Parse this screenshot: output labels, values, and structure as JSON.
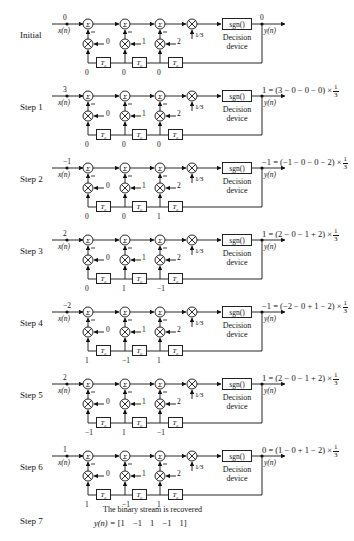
{
  "figure": {
    "decision_device": {
      "box_label": "sgn()",
      "caption_line1": "Decision",
      "caption_line2": "device"
    },
    "input_label": "x(n)",
    "output_label": "y(n)",
    "delay_label": "T",
    "delay_sub": "c",
    "gain_num": "1",
    "gain_den": "3",
    "frac_num": "1",
    "frac_den": "3",
    "coefficients": [
      "0",
      "1",
      "2"
    ],
    "stages": [
      {
        "label": "Initial",
        "input": "0",
        "taps": [
          "0",
          "0",
          "0"
        ],
        "output_value": "0",
        "equation": ""
      },
      {
        "label": "Step 1",
        "input": "3",
        "taps": [
          "0",
          "0",
          "0"
        ],
        "output_value": "",
        "equation": "1 = (3 − 0 − 0 − 0) ×"
      },
      {
        "label": "Step 2",
        "input": "−1",
        "taps": [
          "0",
          "0",
          "1"
        ],
        "output_value": "",
        "equation": "−1 = (−1 − 0 − 0 − 2) ×"
      },
      {
        "label": "Step 3",
        "input": "2",
        "taps": [
          "0",
          "1",
          "−1"
        ],
        "output_value": "",
        "equation": "1 = (2 − 0 − 1 + 2) ×"
      },
      {
        "label": "Step 4",
        "input": "−2",
        "taps": [
          "1",
          "−1",
          "1"
        ],
        "output_value": "",
        "equation": "−1 = (−2 − 0 + 1 − 2) ×"
      },
      {
        "label": "Step 5",
        "input": "2",
        "taps": [
          "−1",
          "1",
          "−1"
        ],
        "output_value": "",
        "equation": "1 = (2 − 0 − 1 + 2) ×"
      },
      {
        "label": "Step 6",
        "input": "1",
        "taps": [
          "1",
          "−1",
          "1"
        ],
        "output_value": "",
        "equation": "0 = (1 − 0 + 1 − 2) ×"
      }
    ],
    "step7": {
      "label": "Step 7",
      "caption": "The binary stream is recovered",
      "result_lhs": "y(n) = ",
      "result_vector": "[1  −1  1  −1  1]"
    }
  }
}
